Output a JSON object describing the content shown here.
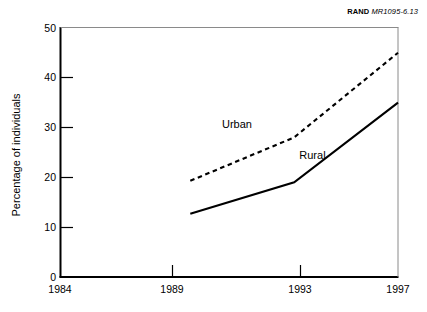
{
  "figure": {
    "credit_mark": "RAND",
    "credit_doc": "MR1095-6.13"
  },
  "chart_data": {
    "type": "line",
    "title": "",
    "subtitle": "",
    "xlabel": "",
    "ylabel": "Percentage of individuals",
    "x": [
      1989,
      1993,
      1997
    ],
    "xlim": [
      1984,
      1997
    ],
    "ylim": [
      0,
      50
    ],
    "x_ticks": [
      1984,
      1989,
      1993,
      1997
    ],
    "x_tick_labels": [
      "1984",
      "1989",
      "1993",
      "1997"
    ],
    "y_ticks": [
      0,
      10,
      20,
      30,
      40,
      50
    ],
    "y_tick_labels": [
      "0",
      "10",
      "20",
      "30",
      "40",
      "50"
    ],
    "grid": false,
    "legend": "inline-annotations",
    "series": [
      {
        "name": "Urban",
        "label": "Urban",
        "style": "dashed",
        "color": "#000000",
        "values": [
          19.3,
          28.0,
          45.0
        ]
      },
      {
        "name": "Rural",
        "label": "Rural",
        "style": "solid",
        "color": "#000000",
        "values": [
          12.7,
          19.0,
          35.0
        ]
      }
    ],
    "annotations": [
      {
        "text": "Urban",
        "x": 1990.8,
        "y": 30.5
      },
      {
        "text": "Rural",
        "x": 1993.7,
        "y": 24.3
      }
    ]
  }
}
